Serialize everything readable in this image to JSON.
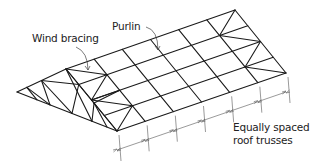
{
  "diagram": {
    "type": "roof-structure-isometric",
    "labels": {
      "wind_bracing": "Wind bracing",
      "purlin": "Purlin",
      "trusses_line1": "Equally spaced",
      "trusses_line2": "roof trusses"
    },
    "stroke_color": "#1a1a1a",
    "dimension_color": "#555555",
    "text_color": "#222222",
    "geometry": {
      "hip_apex": [
        17,
        92
      ],
      "eave_front": [
        117,
        131
      ],
      "ridge_front": [
        66,
        69
      ],
      "ridge_end": [
        235,
        10
      ],
      "eave_end": [
        286,
        73
      ],
      "truss_count": 6,
      "purlin_rows": 4
    }
  }
}
